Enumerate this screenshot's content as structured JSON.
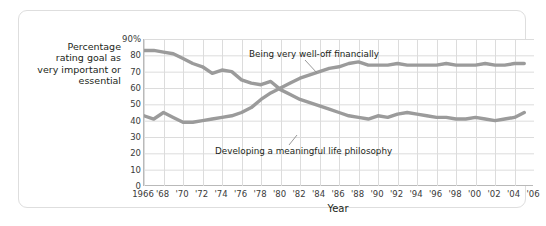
{
  "axis": {
    "y_title": "Percentage rating goal as very important or essential",
    "x_title": "Year"
  },
  "chart_data": {
    "type": "line",
    "title": "",
    "xlabel": "Year",
    "ylabel": "Percentage rating goal as very important or essential",
    "ylim": [
      0,
      90
    ],
    "xlim": [
      1966,
      2006
    ],
    "grid": true,
    "legend_position": "inline-annotation",
    "ytick_labels": [
      "0",
      "10",
      "20",
      "30",
      "40",
      "50",
      "60",
      "70",
      "80",
      "90%"
    ],
    "ytick_values": [
      0,
      10,
      20,
      30,
      40,
      50,
      60,
      70,
      80,
      90
    ],
    "xtick_labels": [
      "1966",
      "'68",
      "'70",
      "'72",
      "'74",
      "'76",
      "'78",
      "'80",
      "'82",
      "'84",
      "'86",
      "'88",
      "'90",
      "'92",
      "'94",
      "'96",
      "'98",
      "'00",
      "'02",
      "'04",
      "'06"
    ],
    "x": [
      1966,
      1967,
      1968,
      1969,
      1970,
      1971,
      1972,
      1973,
      1974,
      1975,
      1976,
      1977,
      1978,
      1979,
      1980,
      1981,
      1982,
      1983,
      1984,
      1985,
      1986,
      1987,
      1988,
      1989,
      1990,
      1991,
      1992,
      1993,
      1994,
      1995,
      1996,
      1997,
      1998,
      1999,
      2000,
      2001,
      2002,
      2003,
      2004,
      2005
    ],
    "series": [
      {
        "name": "Developing a meaningful life philosophy",
        "label": "Developing a meaningful life philosophy",
        "color": "#9b9b9b",
        "values": [
          83,
          83,
          82,
          81,
          78,
          75,
          73,
          69,
          71,
          70,
          65,
          63,
          62,
          64,
          59,
          56,
          53,
          51,
          49,
          47,
          45,
          43,
          42,
          41,
          43,
          42,
          44,
          45,
          44,
          43,
          42,
          42,
          41,
          41,
          42,
          41,
          40,
          41,
          42,
          45
        ]
      },
      {
        "name": "Being very well-off financially",
        "label": "Being very well-off financially",
        "color": "#9b9b9b",
        "values": [
          43,
          41,
          45,
          42,
          39,
          39,
          40,
          41,
          42,
          43,
          45,
          48,
          53,
          57,
          60,
          63,
          66,
          68,
          70,
          72,
          73,
          75,
          76,
          74,
          74,
          74,
          75,
          74,
          74,
          74,
          74,
          75,
          74,
          74,
          74,
          75,
          74,
          74,
          75,
          75
        ]
      }
    ]
  }
}
